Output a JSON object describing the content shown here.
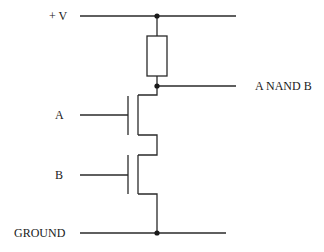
{
  "labels": {
    "supply": "+ V",
    "input_a": "A",
    "input_b": "B",
    "output": "A NAND B",
    "ground": "GROUND"
  },
  "colors": {
    "wire": "#2a2a2a",
    "background": "#ffffff"
  },
  "components": [
    {
      "type": "resistor",
      "name": "pull-up resistor"
    },
    {
      "type": "nmos-transistor",
      "name": "transistor A",
      "gate": "A"
    },
    {
      "type": "nmos-transistor",
      "name": "transistor B",
      "gate": "B"
    }
  ]
}
